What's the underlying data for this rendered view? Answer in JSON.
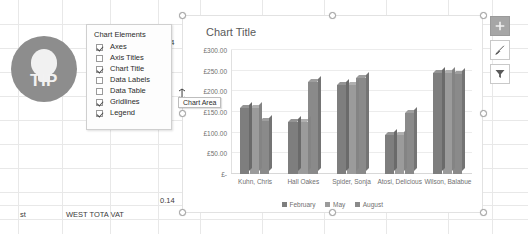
{
  "spreadsheet": {
    "cells": [
      {
        "text": "14",
        "x": 166,
        "y": 38
      },
      {
        "text": "0.14",
        "x": 160,
        "y": 196
      },
      {
        "text": "st",
        "x": 20,
        "y": 210
      },
      {
        "text": "WEST TOTA VAT",
        "x": 66,
        "y": 210
      }
    ]
  },
  "tip_badge": {
    "label": "TIP",
    "icon": "lightbulb-icon",
    "color": "#8d8d8d"
  },
  "chart_elements_panel": {
    "title": "Chart Elements",
    "items": [
      {
        "label": "Axes",
        "checked": true
      },
      {
        "label": "Axis Titles",
        "checked": false
      },
      {
        "label": "Chart Title",
        "checked": true
      },
      {
        "label": "Data Labels",
        "checked": false
      },
      {
        "label": "Data Table",
        "checked": false
      },
      {
        "label": "Gridlines",
        "checked": true
      },
      {
        "label": "Legend",
        "checked": true
      }
    ]
  },
  "tooltip": {
    "text": "Chart Area"
  },
  "floating_buttons": [
    {
      "name": "chart-elements-button",
      "icon": "plus-icon",
      "active": true
    },
    {
      "name": "chart-styles-button",
      "icon": "paintbrush-icon",
      "active": false
    },
    {
      "name": "chart-filters-button",
      "icon": "funnel-icon",
      "active": false
    }
  ],
  "chart_data": {
    "type": "bar",
    "title": "Chart Title",
    "xlabel": "",
    "ylabel": "",
    "ylim": [
      0,
      300
    ],
    "grid": true,
    "legend_position": "bottom",
    "ytick_labels": [
      "£-",
      "£50.00",
      "£100.00",
      "£150.00",
      "£200.00",
      "£250.00",
      "£300.00"
    ],
    "ytick_values": [
      0,
      50,
      100,
      150,
      200,
      250,
      300
    ],
    "categories": [
      "Kuhn, Chris",
      "Hall Oakes",
      "Spider, Sonja",
      "Atosi, Delicious",
      "Wilson, Balabue"
    ],
    "series": [
      {
        "name": "February",
        "values": [
          160,
          125,
          215,
          95,
          245
        ]
      },
      {
        "name": "May",
        "values": [
          160,
          125,
          215,
          95,
          245
        ]
      },
      {
        "name": "August",
        "values": [
          128,
          222,
          232,
          148,
          243
        ]
      }
    ]
  }
}
